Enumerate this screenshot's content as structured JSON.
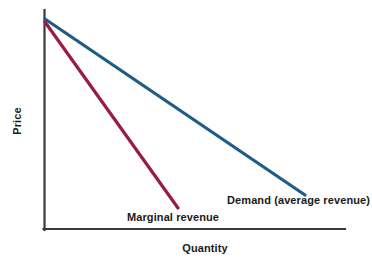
{
  "chart_data": {
    "type": "line",
    "title": "",
    "subtitle": "",
    "xlabel": "Quantity",
    "ylabel": "Price",
    "grid": false,
    "legend_position": "inline-annotation",
    "xlim": [
      0,
      10
    ],
    "ylim": [
      0,
      10
    ],
    "axis_ticks": {
      "x": [],
      "y": []
    },
    "series": [
      {
        "name": "Demand (average revenue)",
        "color": "#1f5c86",
        "linewidth": 3,
        "x": [
          0.1,
          10.0
        ],
        "y": [
          9.6,
          1.55
        ],
        "annotation": "Demand (average revenue)"
      },
      {
        "name": "Marginal revenue",
        "color": "#9b1b43",
        "linewidth": 3,
        "x": [
          0.1,
          5.1
        ],
        "y": [
          9.45,
          1.0
        ],
        "annotation": "Marginal revenue"
      }
    ],
    "annotations": [
      {
        "text": "Demand (average revenue)",
        "x": 7.0,
        "y": 1.1
      },
      {
        "text": "Marginal revenue",
        "x": 3.5,
        "y": 0.45
      }
    ],
    "colors": {
      "demand": "#1f5c86",
      "marginal_revenue": "#9b1b43",
      "axis": "#3a3a3a",
      "text": "#1a1a1a",
      "background": "#ffffff"
    }
  },
  "axes": {
    "y_title": "Price",
    "x_title": "Quantity"
  },
  "labels": {
    "demand": "Demand (average revenue)",
    "marginal_revenue": "Marginal revenue"
  },
  "geometry": {
    "origin": {
      "x": 43,
      "y": 229
    },
    "y_axis_top": 10,
    "x_axis_right": 345,
    "demand_line": {
      "x1": 45,
      "y1": 19,
      "x2": 305,
      "y2": 195
    },
    "mr_line": {
      "x1": 45,
      "y1": 22,
      "x2": 178,
      "y2": 208
    }
  }
}
